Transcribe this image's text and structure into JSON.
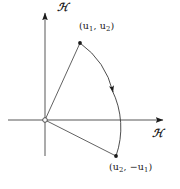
{
  "figure": {
    "type": "vector-rotation-diagram",
    "background_color": "#ffffff",
    "stroke_color": "#1a1a1a",
    "axes": {
      "x": {
        "label": "ℋ",
        "label_name": "script-h",
        "start": [
          8,
          120
        ],
        "end": [
          168,
          120
        ],
        "arrow": "right"
      },
      "y": {
        "label": "ℋ",
        "label_name": "script-h",
        "start": [
          45,
          156
        ],
        "end": [
          45,
          8
        ],
        "arrow": "up"
      },
      "origin": [
        45,
        120
      ]
    },
    "points": [
      {
        "name": "point-u1-u2",
        "label_text": "(u1, u2)",
        "label_parts": [
          "(u",
          "1",
          ", u",
          "2",
          ")"
        ],
        "coords": [
          80,
          43
        ]
      },
      {
        "name": "point-u2-minus-u1",
        "label_text": "(u2, −u1)",
        "label_parts": [
          "(u",
          "2",
          ", −u",
          "1",
          ")"
        ],
        "coords": [
          116,
          156
        ]
      }
    ],
    "vectors": [
      {
        "name": "vector-to-u1-u2",
        "from": [
          45,
          120
        ],
        "to": [
          80,
          43
        ]
      },
      {
        "name": "vector-to-u2-minus-u1",
        "from": [
          45,
          120
        ],
        "to": [
          116,
          156
        ]
      }
    ],
    "arc": {
      "name": "rotation-arc",
      "from": [
        80,
        43
      ],
      "to": [
        116,
        156
      ],
      "radius": 85,
      "direction": "clockwise",
      "arrow_at": [
        113,
        92
      ],
      "crosses_x_axis_at": 126
    }
  }
}
